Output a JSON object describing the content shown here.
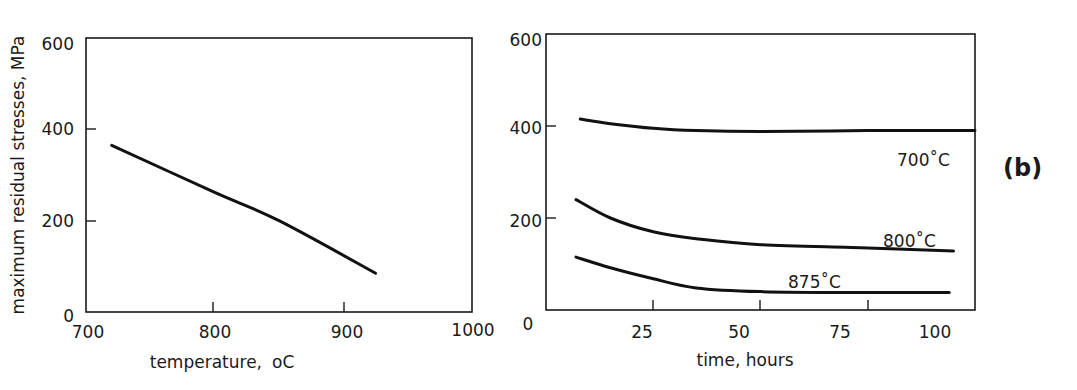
{
  "chart_data": [
    {
      "type": "line",
      "title": "",
      "xlabel": "temperature, °C",
      "ylabel": "maximum residual stresses, MPa",
      "xlim": [
        700,
        1000
      ],
      "ylim": [
        0,
        600
      ],
      "xticks": [
        700,
        800,
        900,
        1000
      ],
      "yticks": [
        0,
        200,
        400,
        600
      ],
      "grid": false,
      "series": [
        {
          "name": "max residual stress vs temperature",
          "x": [
            720,
            800,
            850,
            925
          ],
          "y": [
            365,
            262,
            200,
            85
          ]
        }
      ]
    },
    {
      "type": "line",
      "title": "",
      "panel_label": "(b)",
      "xlabel": "time, hours",
      "ylabel": "",
      "xlim": [
        0,
        100
      ],
      "ylim": [
        0,
        600
      ],
      "xticks": [
        0,
        25,
        50,
        75,
        100
      ],
      "yticks": [
        0,
        200,
        400,
        600
      ],
      "grid": false,
      "legend_position": "inline labels",
      "series": [
        {
          "name": "700˚C",
          "x": [
            8,
            15,
            25,
            35,
            50,
            75,
            100
          ],
          "y": [
            415,
            405,
            395,
            390,
            388,
            390,
            390
          ]
        },
        {
          "name": "800˚C",
          "x": [
            7,
            15,
            25,
            35,
            50,
            75,
            95
          ],
          "y": [
            240,
            200,
            170,
            155,
            142,
            135,
            128
          ]
        },
        {
          "name": "875˚C",
          "x": [
            7,
            15,
            25,
            35,
            50,
            75,
            94
          ],
          "y": [
            115,
            92,
            68,
            48,
            40,
            38,
            38
          ]
        }
      ]
    }
  ],
  "left": {
    "ylabel": "maximum residual stresses, MPa",
    "xlabel": "temperature,",
    "xlabel_unit": "oC",
    "xticks": [
      "700",
      "800",
      "900",
      "1000"
    ],
    "yticks": [
      "0",
      "200",
      "400",
      "600"
    ]
  },
  "right": {
    "xlabel": "time, hours",
    "xticks": [
      "25",
      "50",
      "75",
      "100"
    ],
    "x0": "0",
    "yticks": [
      "200",
      "400",
      "600"
    ],
    "labels": {
      "c700": "700˚C",
      "c800": "800˚C",
      "c875": "875˚C"
    },
    "panel_label": "(b)"
  }
}
